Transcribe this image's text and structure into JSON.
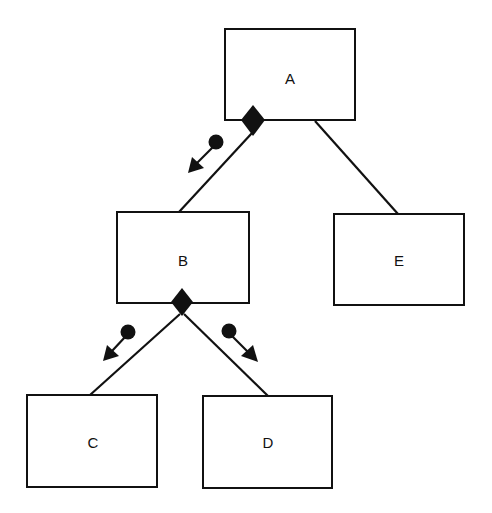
{
  "diagram": {
    "type": "structure-chart",
    "modules": [
      {
        "id": "A",
        "label": "A",
        "x": 225,
        "y": 29,
        "w": 130,
        "h": 91
      },
      {
        "id": "B",
        "label": "B",
        "x": 117,
        "y": 212,
        "w": 132,
        "h": 91
      },
      {
        "id": "E",
        "label": "E",
        "x": 334,
        "y": 214,
        "w": 130,
        "h": 91
      },
      {
        "id": "C",
        "label": "C",
        "x": 27,
        "y": 395,
        "w": 130,
        "h": 92
      },
      {
        "id": "D",
        "label": "D",
        "x": 203,
        "y": 396,
        "w": 129,
        "h": 92
      }
    ],
    "connections": [
      {
        "from": "A",
        "to": "B",
        "conditional": true
      },
      {
        "from": "A",
        "to": "E",
        "conditional": false
      },
      {
        "from": "B",
        "to": "C",
        "conditional": true
      },
      {
        "from": "B",
        "to": "D",
        "conditional": true
      }
    ],
    "couples": [
      {
        "on": "A-B",
        "kind": "control-flag",
        "direction": "down"
      },
      {
        "on": "B-C",
        "kind": "control-flag",
        "direction": "down"
      },
      {
        "on": "B-D",
        "kind": "control-flag",
        "direction": "down"
      }
    ]
  }
}
